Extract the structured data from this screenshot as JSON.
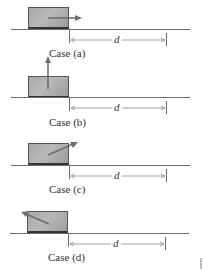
{
  "figure": {
    "dimension_label": "d",
    "cases": [
      {
        "id": "a",
        "caption": "Case (a)",
        "force_direction": "horizontal-right",
        "ground_y": 29
      },
      {
        "id": "b",
        "caption": "Case (b)",
        "force_direction": "vertical-up",
        "ground_y": 97
      },
      {
        "id": "c",
        "caption": "Case (c)",
        "force_direction": "angled-up-right",
        "ground_y": 165
      },
      {
        "id": "d",
        "caption": "Case (d)",
        "force_direction": "angled-up-left",
        "ground_y": 233
      }
    ]
  },
  "colors": {
    "block_fill": "#b0b0b0",
    "block_border": "#555555",
    "line": "#6b6b6b",
    "arrow": "#6e6e6e",
    "text": "#333333"
  }
}
